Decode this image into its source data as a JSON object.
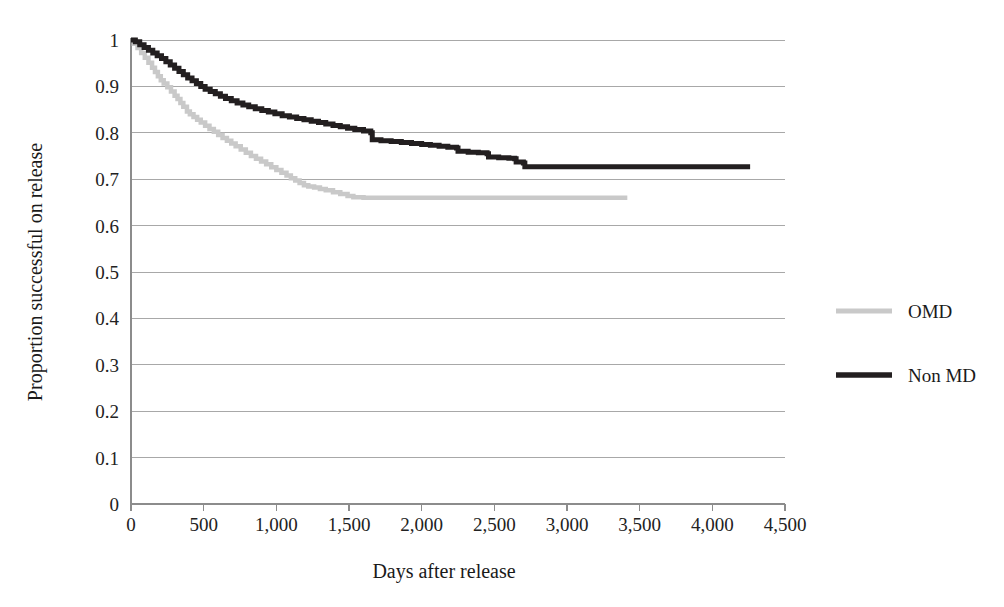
{
  "chart_data": {
    "type": "line",
    "title": "",
    "subtitle": "",
    "xlabel": "Days after release",
    "ylabel": "Proportion successful on release",
    "xlim": [
      0,
      4500
    ],
    "ylim": [
      0,
      1
    ],
    "xticks": [
      0,
      500,
      1000,
      1500,
      2000,
      2500,
      3000,
      3500,
      4000,
      4500
    ],
    "xtick_labels": [
      "0",
      "500",
      "1,000",
      "1,500",
      "2,000",
      "2,500",
      "3,000",
      "3,500",
      "4,000",
      "4,500"
    ],
    "yticks": [
      0,
      0.1,
      0.2,
      0.3,
      0.4,
      0.5,
      0.6,
      0.7,
      0.8,
      0.9,
      1
    ],
    "ytick_labels": [
      "0",
      "0.1",
      "0.2",
      "0.3",
      "0.4",
      "0.5",
      "0.6",
      "0.7",
      "0.8",
      "0.9",
      "1"
    ],
    "grid": true,
    "grid_axis": "y",
    "legend_position": "right",
    "series": [
      {
        "name": "OMD",
        "color": "#c9c9c9",
        "stroke_width": 4.5,
        "step": true,
        "points": [
          [
            0,
            1.0
          ],
          [
            20,
            0.992
          ],
          [
            45,
            0.983
          ],
          [
            70,
            0.972
          ],
          [
            95,
            0.962
          ],
          [
            120,
            0.951
          ],
          [
            145,
            0.94
          ],
          [
            165,
            0.931
          ],
          [
            185,
            0.922
          ],
          [
            205,
            0.913
          ],
          [
            225,
            0.906
          ],
          [
            250,
            0.898
          ],
          [
            275,
            0.889
          ],
          [
            300,
            0.88
          ],
          [
            320,
            0.873
          ],
          [
            340,
            0.864
          ],
          [
            360,
            0.856
          ],
          [
            385,
            0.846
          ],
          [
            405,
            0.84
          ],
          [
            430,
            0.834
          ],
          [
            455,
            0.828
          ],
          [
            480,
            0.822
          ],
          [
            510,
            0.815
          ],
          [
            540,
            0.808
          ],
          [
            570,
            0.802
          ],
          [
            600,
            0.795
          ],
          [
            630,
            0.789
          ],
          [
            660,
            0.783
          ],
          [
            690,
            0.777
          ],
          [
            720,
            0.771
          ],
          [
            755,
            0.764
          ],
          [
            790,
            0.757
          ],
          [
            825,
            0.75
          ],
          [
            860,
            0.744
          ],
          [
            895,
            0.738
          ],
          [
            930,
            0.732
          ],
          [
            965,
            0.726
          ],
          [
            1000,
            0.72
          ],
          [
            1035,
            0.714
          ],
          [
            1070,
            0.708
          ],
          [
            1100,
            0.702
          ],
          [
            1130,
            0.697
          ],
          [
            1160,
            0.692
          ],
          [
            1190,
            0.687
          ],
          [
            1220,
            0.684
          ],
          [
            1260,
            0.682
          ],
          [
            1300,
            0.679
          ],
          [
            1340,
            0.676
          ],
          [
            1390,
            0.672
          ],
          [
            1440,
            0.668
          ],
          [
            1490,
            0.664
          ],
          [
            1530,
            0.661
          ],
          [
            1600,
            0.66
          ],
          [
            2000,
            0.66
          ],
          [
            2500,
            0.66
          ],
          [
            3000,
            0.66
          ],
          [
            3415,
            0.66
          ]
        ],
        "end_x": 3415,
        "end_y": 0.66
      },
      {
        "name": "Non MD",
        "color": "#231f20",
        "stroke_width": 5,
        "step": true,
        "points": [
          [
            0,
            1.0
          ],
          [
            30,
            0.996
          ],
          [
            60,
            0.99
          ],
          [
            90,
            0.984
          ],
          [
            120,
            0.978
          ],
          [
            150,
            0.972
          ],
          [
            180,
            0.966
          ],
          [
            210,
            0.96
          ],
          [
            240,
            0.953
          ],
          [
            270,
            0.946
          ],
          [
            300,
            0.939
          ],
          [
            330,
            0.932
          ],
          [
            360,
            0.925
          ],
          [
            390,
            0.918
          ],
          [
            420,
            0.912
          ],
          [
            450,
            0.906
          ],
          [
            480,
            0.9
          ],
          [
            510,
            0.894
          ],
          [
            545,
            0.889
          ],
          [
            580,
            0.884
          ],
          [
            615,
            0.879
          ],
          [
            650,
            0.874
          ],
          [
            690,
            0.869
          ],
          [
            730,
            0.864
          ],
          [
            770,
            0.86
          ],
          [
            810,
            0.856
          ],
          [
            855,
            0.852
          ],
          [
            900,
            0.848
          ],
          [
            945,
            0.845
          ],
          [
            990,
            0.841
          ],
          [
            1040,
            0.837
          ],
          [
            1090,
            0.834
          ],
          [
            1140,
            0.831
          ],
          [
            1190,
            0.828
          ],
          [
            1240,
            0.825
          ],
          [
            1290,
            0.822
          ],
          [
            1340,
            0.819
          ],
          [
            1390,
            0.816
          ],
          [
            1440,
            0.813
          ],
          [
            1490,
            0.81
          ],
          [
            1540,
            0.807
          ],
          [
            1600,
            0.804
          ],
          [
            1650,
            0.8
          ],
          [
            1660,
            0.785
          ],
          [
            1720,
            0.783
          ],
          [
            1790,
            0.781
          ],
          [
            1860,
            0.779
          ],
          [
            1930,
            0.777
          ],
          [
            2000,
            0.775
          ],
          [
            2060,
            0.773
          ],
          [
            2120,
            0.771
          ],
          [
            2180,
            0.769
          ],
          [
            2240,
            0.767
          ],
          [
            2250,
            0.76
          ],
          [
            2320,
            0.758
          ],
          [
            2390,
            0.757
          ],
          [
            2450,
            0.755
          ],
          [
            2460,
            0.748
          ],
          [
            2530,
            0.746
          ],
          [
            2600,
            0.745
          ],
          [
            2640,
            0.744
          ],
          [
            2650,
            0.737
          ],
          [
            2700,
            0.735
          ],
          [
            2710,
            0.727
          ],
          [
            2800,
            0.727
          ],
          [
            3000,
            0.727
          ],
          [
            3500,
            0.727
          ],
          [
            4000,
            0.727
          ],
          [
            4260,
            0.727
          ]
        ],
        "end_x": 4260,
        "end_y": 0.727
      }
    ]
  },
  "legend": {
    "items": [
      {
        "label": "OMD",
        "color": "#c9c9c9"
      },
      {
        "label": "Non MD",
        "color": "#231f20"
      }
    ]
  },
  "axes": {
    "x_title": "Days after release",
    "y_title": "Proportion successful on release"
  }
}
